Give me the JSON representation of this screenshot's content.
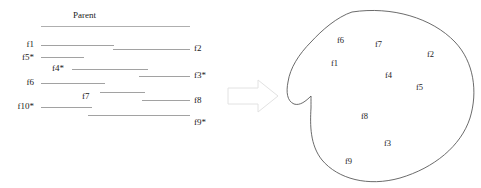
{
  "figure": {
    "colors": {
      "line": "#8a8a8a",
      "parent_line": "#9a9a9a",
      "blob_outline": "#5a5a5a",
      "arrow_outline": "#e2e2e2",
      "text": "#1a1a1a",
      "background": "#ffffff"
    },
    "left_panel": {
      "parent": {
        "label": "Parent",
        "label_x": 91,
        "label_y": 13,
        "line_x1": 41,
        "line_x2": 190,
        "line_y": 26.5
      },
      "left_labeled_fragments": [
        {
          "label": "f1",
          "label_x": 23,
          "label_y": 42,
          "line_x1": 41,
          "line_x2": 114,
          "line_y": 45.5
        },
        {
          "label": "f5*",
          "label_x": 20,
          "label_y": 55,
          "line_x1": 41,
          "line_x2": 84,
          "line_y": 57.5
        },
        {
          "label": "f4*",
          "label_x": 54,
          "label_y": 66,
          "line_x1": 72,
          "line_x2": 148,
          "line_y": 69.5
        },
        {
          "label": "f6",
          "label_x": 23,
          "label_y": 81,
          "line_x1": 41,
          "line_x2": 105,
          "line_y": 83.5
        },
        {
          "label": "f7",
          "label_x": 83,
          "label_y": 94,
          "line_x1": 100,
          "line_x2": 145,
          "line_y": 92.5
        },
        {
          "label": "f10*",
          "label_x": 13,
          "label_y": 105,
          "line_x1": 41,
          "line_x2": 92,
          "line_y": 107.5
        }
      ],
      "right_labeled_fragments": [
        {
          "label": "f2",
          "label_x": 194,
          "label_y": 46,
          "line_x1": 113,
          "line_x2": 190,
          "line_y": 49.5
        },
        {
          "label": "f3*",
          "label_x": 194,
          "label_y": 73,
          "line_x1": 139,
          "line_x2": 190,
          "line_y": 76.5
        },
        {
          "label": "f8",
          "label_x": 194,
          "label_y": 100,
          "line_x1": 142,
          "line_x2": 190,
          "line_y": 100.5
        },
        {
          "label": "f9*",
          "label_x": 194,
          "label_y": 120,
          "line_x1": 88,
          "line_x2": 190,
          "line_y": 115.5
        }
      ]
    },
    "arrow": {
      "name": "right-arrow",
      "x": 228,
      "y": 80,
      "width": 48,
      "height": 32
    },
    "right_panel": {
      "region_label": "region blob",
      "items": [
        {
          "label": "f6",
          "x": 337,
          "y": 40
        },
        {
          "label": "f7",
          "x": 375,
          "y": 44
        },
        {
          "label": "f2",
          "x": 427,
          "y": 54
        },
        {
          "label": "f1",
          "x": 331,
          "y": 62
        },
        {
          "label": "f4",
          "x": 385,
          "y": 75
        },
        {
          "label": "f5",
          "x": 416,
          "y": 86
        },
        {
          "label": "f8",
          "x": 361,
          "y": 115
        },
        {
          "label": "f3",
          "x": 384,
          "y": 142
        },
        {
          "label": "f9",
          "x": 345,
          "y": 160
        }
      ]
    }
  }
}
